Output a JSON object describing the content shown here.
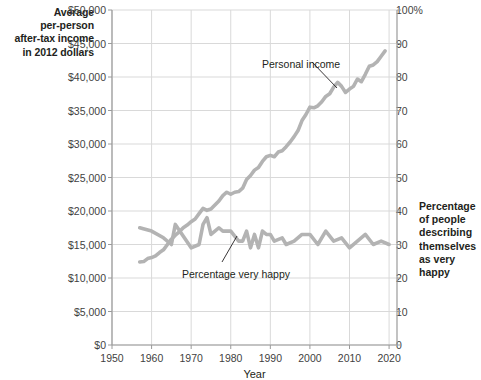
{
  "captions": {
    "left_axis_label": "Average\nper-person\nafter-tax income\nin 2012 dollars",
    "right_axis_label": "Percentage\nof people\ndescribing\nthemselves\nas very happy"
  },
  "chart_data": {
    "type": "line",
    "title": "",
    "xlabel": "Year",
    "ylabel": "Average per-person after-tax income in 2012 dollars",
    "y2label": "Percentage of people describing themselves as very happy",
    "grid": true,
    "legend_position": "inline-annotations",
    "xlim": [
      1950,
      2022
    ],
    "xticks": [
      1950,
      1960,
      1970,
      1980,
      1990,
      2000,
      2010,
      2020
    ],
    "xticklabels": [
      "1950",
      "1960",
      "1970",
      "1980",
      "1990",
      "2000",
      "2010",
      "2020"
    ],
    "ylim": [
      0,
      50000
    ],
    "yticks": [
      0,
      5000,
      10000,
      15000,
      20000,
      25000,
      30000,
      35000,
      40000,
      45000,
      50000
    ],
    "yticklabels": [
      "$0",
      "$5,000",
      "$10,000",
      "$15,000",
      "$20,000",
      "$25,000",
      "$30,000",
      "$35,000",
      "$40,000",
      "$45,000",
      "$50,000"
    ],
    "y2lim": [
      0,
      100
    ],
    "y2ticks": [
      0,
      10,
      20,
      30,
      40,
      50,
      60,
      70,
      80,
      90,
      100
    ],
    "y2ticklabels": [
      "0",
      "10",
      "20",
      "30",
      "40",
      "50",
      "60",
      "70",
      "80",
      "90",
      "100%"
    ],
    "series": [
      {
        "name": "Personal income",
        "axis": "left",
        "color": "#b3b3b3",
        "annotation": "Personal income",
        "x": [
          1957,
          1958,
          1959,
          1960,
          1961,
          1962,
          1963,
          1964,
          1965,
          1966,
          1967,
          1968,
          1969,
          1970,
          1971,
          1972,
          1973,
          1974,
          1975,
          1976,
          1977,
          1978,
          1979,
          1980,
          1981,
          1982,
          1983,
          1984,
          1985,
          1986,
          1987,
          1988,
          1989,
          1990,
          1991,
          1992,
          1993,
          1994,
          1995,
          1996,
          1997,
          1998,
          1999,
          2000,
          2001,
          2002,
          2003,
          2004,
          2005,
          2006,
          2007,
          2008,
          2009,
          2010,
          2011,
          2012,
          2013,
          2014,
          2015,
          2016,
          2017,
          2018,
          2019
        ],
        "values": [
          12400,
          12450,
          12900,
          13050,
          13300,
          13800,
          14200,
          15000,
          15800,
          16400,
          16900,
          17500,
          17900,
          18400,
          18800,
          19600,
          20400,
          20100,
          20300,
          20900,
          21500,
          22300,
          22800,
          22500,
          22800,
          22900,
          23400,
          24700,
          25300,
          26100,
          26500,
          27400,
          28100,
          28300,
          28100,
          28800,
          29000,
          29600,
          30300,
          31100,
          32000,
          33500,
          34400,
          35500,
          35400,
          35700,
          36300,
          37100,
          37500,
          38500,
          39200,
          38600,
          37700,
          38200,
          38600,
          39700,
          39300,
          40400,
          41600,
          41800,
          42300,
          43100,
          43900
        ]
      },
      {
        "name": "Percentage very happy",
        "axis": "right",
        "color": "#b3b3b3",
        "annotation": "Percentage very happy",
        "x": [
          1957,
          1960,
          1963,
          1965,
          1966,
          1970,
          1972,
          1973,
          1974,
          1975,
          1976,
          1977,
          1978,
          1980,
          1982,
          1983,
          1984,
          1985,
          1986,
          1987,
          1988,
          1989,
          1990,
          1991,
          1993,
          1994,
          1996,
          1998,
          2000,
          2002,
          2004,
          2006,
          2008,
          2010,
          2012,
          2014,
          2016,
          2018,
          2020
        ],
        "values": [
          35,
          34,
          32,
          30,
          36,
          29,
          30,
          36,
          38,
          33,
          34,
          35,
          34,
          34,
          31,
          31,
          34,
          29,
          33,
          29,
          34,
          33,
          33,
          31,
          32,
          30,
          31,
          33,
          33,
          30,
          34,
          31,
          32,
          29,
          31,
          33,
          30,
          31,
          30
        ]
      }
    ],
    "annotations": [
      {
        "text": "Personal income",
        "x_px": 262,
        "y_px": 58
      },
      {
        "text": "Percentage very happy",
        "x_px": 182,
        "y_px": 268
      }
    ]
  },
  "colors": {
    "line": "#b3b3b3",
    "grid": "#d9d9d9",
    "axis": "#9a9a9a",
    "text": "#231f20",
    "tick_text": "#3f3f3f",
    "background": "#ffffff"
  }
}
